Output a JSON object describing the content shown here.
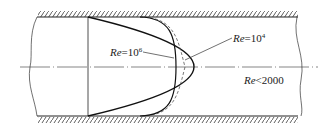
{
  "diagram": {
    "labels": {
      "re_1e4": {
        "prefix": "Re",
        "eq": "=10",
        "exp": "4"
      },
      "re_1e6": {
        "prefix": "Re",
        "eq": "=10",
        "exp": "6"
      },
      "re_laminar": {
        "prefix": "Re",
        "rest": "<2000"
      }
    },
    "colors": {
      "line": "#222222",
      "dashed": "#555555",
      "background": "#ffffff"
    },
    "curves": [
      {
        "name": "laminar",
        "reynolds": "Re<2000",
        "shape": "parabolic",
        "style": "solid"
      },
      {
        "name": "turbulent-1e4",
        "reynolds": "Re=10^4",
        "shape": "blunt",
        "style": "dashed"
      },
      {
        "name": "turbulent-1e6",
        "reynolds": "Re=10^6",
        "shape": "flatter",
        "style": "solid"
      }
    ]
  }
}
